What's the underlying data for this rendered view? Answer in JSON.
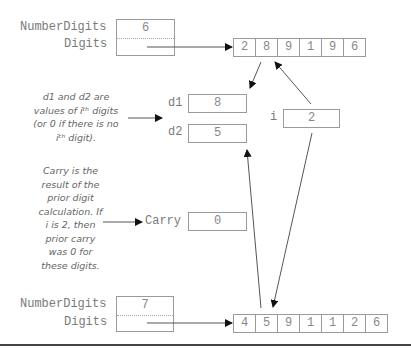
{
  "top_record": {
    "number_digits_label": "NumberDigits",
    "digits_label": "Digits",
    "number_digits_value": "6"
  },
  "top_array": [
    "2",
    "8",
    "9",
    "1",
    "9",
    "6"
  ],
  "bottom_record": {
    "number_digits_label": "NumberDigits",
    "digits_label": "Digits",
    "number_digits_value": "7"
  },
  "bottom_array": [
    "4",
    "5",
    "9",
    "1",
    "1",
    "2",
    "6"
  ],
  "variables": {
    "d1": {
      "label": "d1",
      "value": "8"
    },
    "d2": {
      "label": "d2",
      "value": "5"
    },
    "i": {
      "label": "i",
      "value": "2"
    },
    "carry": {
      "label": "Carry",
      "value": "0"
    }
  },
  "notes": {
    "d_note": [
      "d1 and d2 are",
      "values of iᵗʰ digits",
      "(or 0 if there is no",
      "iᵗʰ digit)."
    ],
    "carry_note": [
      "Carry is the",
      "result of the",
      "prior digit",
      "calculation.  If",
      "i is 2, then",
      "prior carry",
      "was 0 for",
      "these digits."
    ]
  }
}
